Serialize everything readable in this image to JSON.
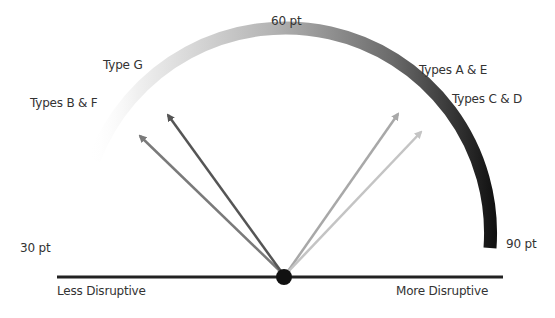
{
  "diagram": {
    "scale_labels": {
      "left": "30 pt",
      "top": "60 pt",
      "right": "90 pt"
    },
    "axis_labels": {
      "left": "Less Disruptive",
      "right": "More Disruptive"
    },
    "type_labels": [
      {
        "id": "types-b-f",
        "text": "Types B & F"
      },
      {
        "id": "type-g",
        "text": "Type G"
      },
      {
        "id": "types-a-e",
        "text": "Types A & E"
      },
      {
        "id": "types-c-d",
        "text": "Types C & D"
      }
    ],
    "arc_gradient": {
      "start": "#ffffff",
      "mid": "#9a9a9a",
      "end": "#111111"
    },
    "arrows": [
      {
        "label": "Types B & F",
        "color": "#7a7a7a",
        "tip": [
          138,
          134
        ]
      },
      {
        "label": "Type G",
        "color": "#555555",
        "tip": [
          166,
          113
        ]
      },
      {
        "label": "Types A & E",
        "color": "#a8a8a8",
        "tip": [
          400,
          112
        ]
      },
      {
        "label": "Types C & D",
        "color": "#c4c4c4",
        "tip": [
          423,
          130
        ]
      }
    ],
    "pivot_color": "#111111",
    "baseline_color": "#222222"
  }
}
